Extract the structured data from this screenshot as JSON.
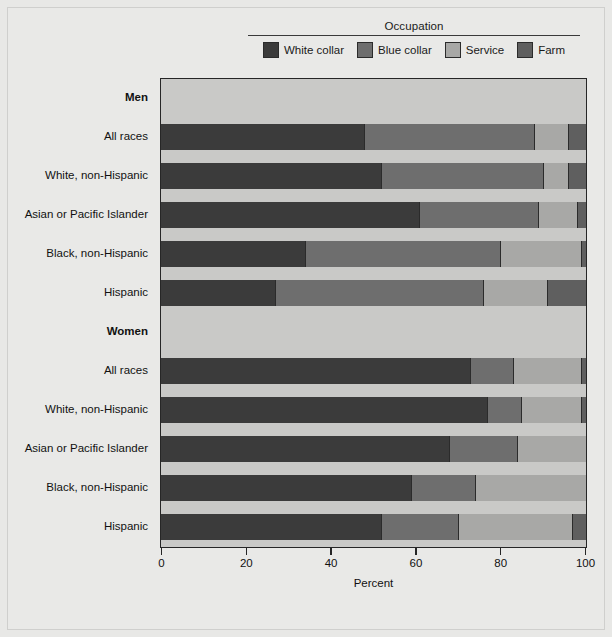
{
  "chart_data": {
    "type": "bar",
    "subtype": "horizontal stacked bar (100%)",
    "title": "",
    "legend_title": "Occupation",
    "legend_position": "top-center",
    "xlabel": "Percent",
    "ylabel": "",
    "xlim": [
      0,
      100
    ],
    "xticks": [
      0,
      20,
      40,
      60,
      80,
      100
    ],
    "xtick_labels": [
      "0",
      "20",
      "40",
      "60",
      "80",
      "100"
    ],
    "grid": false,
    "series": [
      {
        "name": "White collar",
        "color": "#3b3b3b",
        "values": [
          48,
          52,
          61,
          34,
          27,
          73,
          77,
          68,
          59,
          52
        ]
      },
      {
        "name": "Blue collar",
        "color": "#6e6e6e",
        "values": [
          40,
          38,
          28,
          46,
          49,
          10,
          8,
          16,
          15,
          18
        ]
      },
      {
        "name": "Service",
        "color": "#a8a8a6",
        "values": [
          8,
          6,
          9,
          19,
          15,
          16,
          14,
          16,
          26,
          27
        ]
      },
      {
        "name": "Farm",
        "color": "#5f5f5f",
        "values": [
          4,
          4,
          2,
          1,
          9,
          1,
          1,
          0,
          0,
          3
        ]
      }
    ],
    "categories": [
      "All races",
      "White, non-Hispanic",
      "Asian or Pacific Islander",
      "Black, non-Hispanic",
      "Hispanic",
      "All races",
      "White, non-Hispanic",
      "Asian or Pacific Islander",
      "Black, non-Hispanic",
      "Hispanic"
    ],
    "groups": [
      {
        "label": "Men",
        "categories": [
          "All races",
          "White, non-Hispanic",
          "Asian or Pacific Islander",
          "Black, non-Hispanic",
          "Hispanic"
        ]
      },
      {
        "label": "Women",
        "categories": [
          "All races",
          "White, non-Hispanic",
          "Asian or Pacific Islander",
          "Black, non-Hispanic",
          "Hispanic"
        ]
      }
    ]
  },
  "legend": {
    "title": "Occupation",
    "items": [
      {
        "label": "White collar",
        "color": "#3b3b3b"
      },
      {
        "label": "Blue collar",
        "color": "#6e6e6e"
      },
      {
        "label": "Service",
        "color": "#a8a8a6"
      },
      {
        "label": "Farm",
        "color": "#5f5f5f"
      }
    ]
  },
  "axis": {
    "x_title": "Percent",
    "ticks": [
      "0",
      "20",
      "40",
      "60",
      "80",
      "100"
    ]
  },
  "rows": [
    {
      "label": "Men",
      "kind": "group"
    },
    {
      "label": "All races",
      "kind": "bar",
      "values": [
        48,
        40,
        8,
        4
      ]
    },
    {
      "label": "White, non-Hispanic",
      "kind": "bar",
      "values": [
        52,
        38,
        6,
        4
      ]
    },
    {
      "label": "Asian or Pacific Islander",
      "kind": "bar",
      "values": [
        61,
        28,
        9,
        2
      ]
    },
    {
      "label": "Black, non-Hispanic",
      "kind": "bar",
      "values": [
        34,
        46,
        19,
        1
      ]
    },
    {
      "label": "Hispanic",
      "kind": "bar",
      "values": [
        27,
        49,
        15,
        9
      ]
    },
    {
      "label": "Women",
      "kind": "group"
    },
    {
      "label": "All races",
      "kind": "bar",
      "values": [
        73,
        10,
        16,
        1
      ]
    },
    {
      "label": "White, non-Hispanic",
      "kind": "bar",
      "values": [
        77,
        8,
        14,
        1
      ]
    },
    {
      "label": "Asian or Pacific Islander",
      "kind": "bar",
      "values": [
        68,
        16,
        16,
        0
      ]
    },
    {
      "label": "Black, non-Hispanic",
      "kind": "bar",
      "values": [
        59,
        15,
        26,
        0
      ]
    },
    {
      "label": "Hispanic",
      "kind": "bar",
      "values": [
        52,
        18,
        27,
        3
      ]
    }
  ],
  "colors": {
    "white_collar": "#3b3b3b",
    "blue_collar": "#6e6e6e",
    "service": "#a8a8a6",
    "farm": "#5f5f5f",
    "plot_background": "#c9c9c7",
    "page_background": "#e9e9e7",
    "axis": "#262626"
  }
}
